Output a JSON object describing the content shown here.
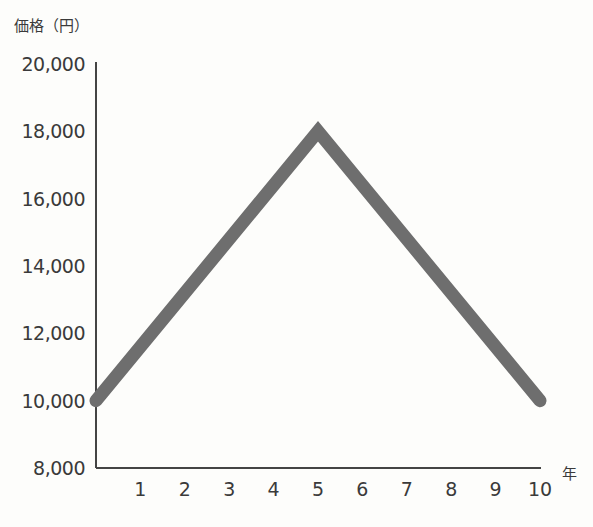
{
  "chart_data": {
    "type": "line",
    "title": "",
    "xlabel": "年",
    "ylabel": "価格（円）",
    "x": [
      0,
      5,
      10
    ],
    "series": [
      {
        "name": "価格",
        "values": [
          10000,
          18000,
          10000
        ]
      }
    ],
    "x_ticks": [
      "1",
      "2",
      "3",
      "4",
      "5",
      "6",
      "7",
      "8",
      "9",
      "10"
    ],
    "y_ticks": [
      "20,000",
      "18,000",
      "16,000",
      "14,000",
      "12,000",
      "10,000",
      "8,000"
    ],
    "xlim": [
      0,
      10
    ],
    "ylim": [
      8000,
      20000
    ],
    "grid": false,
    "line_color": "#6e6e6e"
  },
  "labels": {
    "y_title": "価格（円）",
    "x_unit": "年"
  }
}
